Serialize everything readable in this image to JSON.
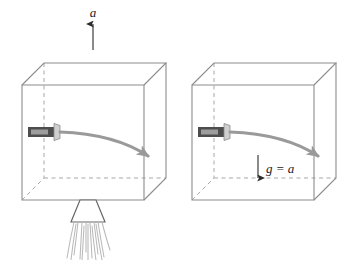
{
  "figure": {
    "background_color": "#ffffff",
    "edge_color": "#8c8c8c",
    "hidden_edge_color": "#a8a8a8",
    "beam_color": "#9a9a9a",
    "arrow_color": "#2b2b2b",
    "flashlight_body_color": "#4d4d4d",
    "flashlight_head_color": "#cfcfcf",
    "flame_color": "#b9b9b9",
    "nozzle_color": "#666666"
  },
  "panels": [
    {
      "id": "left",
      "name": "accelerating-box",
      "caption_label": "a",
      "caption_meaning": "acceleration",
      "acceleration_arrow": {
        "direction": "up",
        "x": 93,
        "y_tail": 50,
        "y_head": 22
      },
      "box": {
        "front": {
          "x": 22,
          "y": 85,
          "w": 122,
          "h": 115
        },
        "depth_dx": 22,
        "depth_dy": -22
      },
      "flashlight": {
        "x": 28,
        "y": 127,
        "body_w": 26,
        "body_h": 10
      },
      "beam": {
        "start_x": 60,
        "start_y": 132,
        "ctrl_x": 115,
        "ctrl_y": 134,
        "end_x": 152,
        "end_y": 158
      },
      "rocket": {
        "nozzle_top_x": 80,
        "nozzle_top_y": 200,
        "nozzle_top_w": 16,
        "nozzle_bottom_w": 34,
        "nozzle_h": 22,
        "flame_count": 13,
        "flame_length": 44
      }
    },
    {
      "id": "right",
      "name": "box-at-rest-in-gravity",
      "caption_label": "g = a",
      "caption_meaning": "gravitational field equal to acceleration",
      "gravity_arrow": {
        "direction": "down",
        "x": 258,
        "y_tail": 155,
        "y_head": 180
      },
      "box": {
        "front": {
          "x": 192,
          "y": 85,
          "w": 122,
          "h": 115
        },
        "depth_dx": 22,
        "depth_dy": -22
      },
      "flashlight": {
        "x": 198,
        "y": 127,
        "body_w": 26,
        "body_h": 10
      },
      "beam": {
        "start_x": 230,
        "start_y": 132,
        "ctrl_x": 285,
        "ctrl_y": 134,
        "end_x": 322,
        "end_y": 158
      }
    }
  ]
}
